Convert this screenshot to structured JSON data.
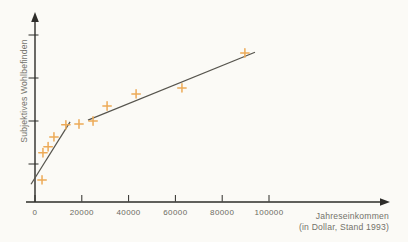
{
  "figure": {
    "background": "#fbfaf6"
  },
  "chart_data": {
    "type": "scatter",
    "title": "",
    "xlabel": "Jahreseinkommen",
    "xlabel_line2": "(in Dollar, Stand 1993)",
    "ylabel": "Subjektives Wohlbefinden",
    "x_axis_unit": "Dollar (Stand 1993)",
    "y_axis_numeric_labels": false,
    "y_units_note": "arbitrary units, axis ticks unlabeled",
    "xlim": [
      0,
      105000
    ],
    "ylim_units": [
      0,
      4.5
    ],
    "grid": false,
    "legend": "none",
    "x_ticks": [
      {
        "value": 0,
        "label": "0"
      },
      {
        "value": 20000,
        "label": "20000"
      },
      {
        "value": 40000,
        "label": "40000"
      },
      {
        "value": 60000,
        "label": "60000"
      },
      {
        "value": 80000,
        "label": "80000"
      },
      {
        "value": 100000,
        "label": "100000"
      }
    ],
    "y_ticks_units": [
      1,
      2,
      3,
      4
    ],
    "points": [
      {
        "income": 3000,
        "wellbeing": 0.63
      },
      {
        "income": 3400,
        "wellbeing": 1.26
      },
      {
        "income": 5600,
        "wellbeing": 1.4
      },
      {
        "income": 8100,
        "wellbeing": 1.63
      },
      {
        "income": 13200,
        "wellbeing": 1.91
      },
      {
        "income": 18800,
        "wellbeing": 1.93
      },
      {
        "income": 24800,
        "wellbeing": 2.0
      },
      {
        "income": 30800,
        "wellbeing": 2.35
      },
      {
        "income": 43200,
        "wellbeing": 2.63
      },
      {
        "income": 62800,
        "wellbeing": 2.77
      },
      {
        "income": 89700,
        "wellbeing": 3.58
      }
    ],
    "trend_segments": [
      {
        "x1": -1700,
        "y1": 0.53,
        "x2": 15000,
        "y2": 1.98
      },
      {
        "x1": 22650,
        "y1": 2.02,
        "x2": 94000,
        "y2": 3.6
      }
    ],
    "colors": {
      "bg": "#fbfaf6",
      "axis": "#2d2c29",
      "trend": "#56544d",
      "point": "#edaa57",
      "label": "#6b6a62",
      "caption": "#73726a"
    }
  }
}
